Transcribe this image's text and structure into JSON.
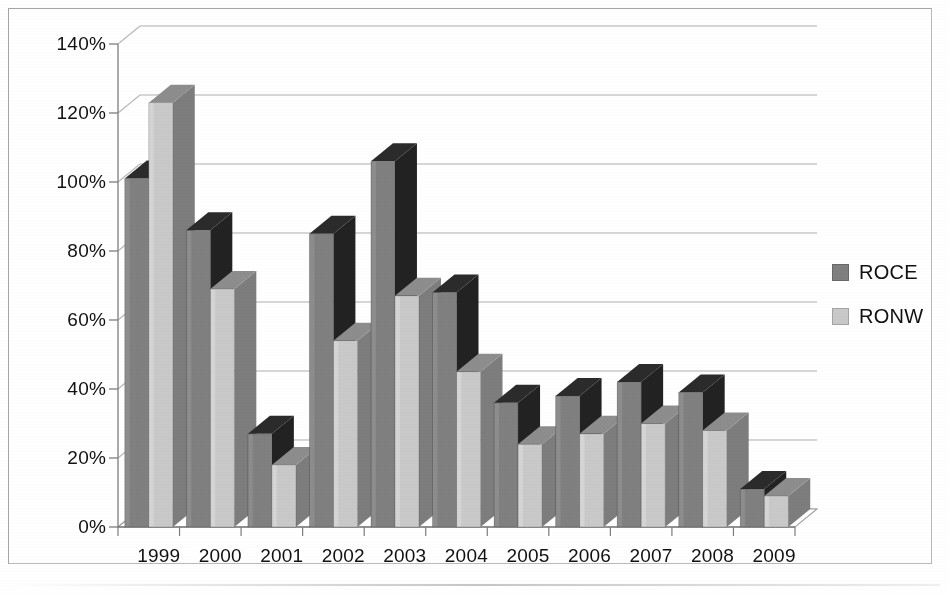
{
  "chart_data": {
    "type": "bar",
    "title": "",
    "subtitle": "",
    "xlabel": "",
    "ylabel": "",
    "categories": [
      "1999",
      "2000",
      "2001",
      "2002",
      "2003",
      "2004",
      "2005",
      "2006",
      "2007",
      "2008",
      "2009"
    ],
    "series": [
      {
        "name": "ROCE",
        "color": "#808080",
        "values": [
          101,
          86,
          27,
          85,
          106,
          68,
          36,
          38,
          42,
          39,
          11
        ]
      },
      {
        "name": "RONW",
        "color": "#c9c9c9",
        "values": [
          123,
          69,
          18,
          54,
          67,
          45,
          24,
          27,
          30,
          28,
          9
        ]
      }
    ],
    "ylim": [
      0,
      140
    ],
    "ytick_step": 20,
    "ytick_labels": [
      "0%",
      "20%",
      "40%",
      "60%",
      "80%",
      "100%",
      "120%",
      "140%"
    ],
    "ytick_values": [
      0,
      20,
      40,
      60,
      80,
      100,
      120,
      140
    ],
    "grid": true,
    "grid_axis": "y",
    "legend_position": "right",
    "value_suffix": "%",
    "style": "3d-column",
    "gridline_color": "#9a9a9a",
    "axis_color": "#7d7d7d",
    "background": "#ffffff"
  },
  "legend": {
    "items": [
      {
        "label": "ROCE",
        "color": "#808080",
        "swatch_name": "legend-swatch-roce"
      },
      {
        "label": "RONW",
        "color": "#c9c9c9",
        "swatch_name": "legend-swatch-ronw"
      }
    ]
  }
}
